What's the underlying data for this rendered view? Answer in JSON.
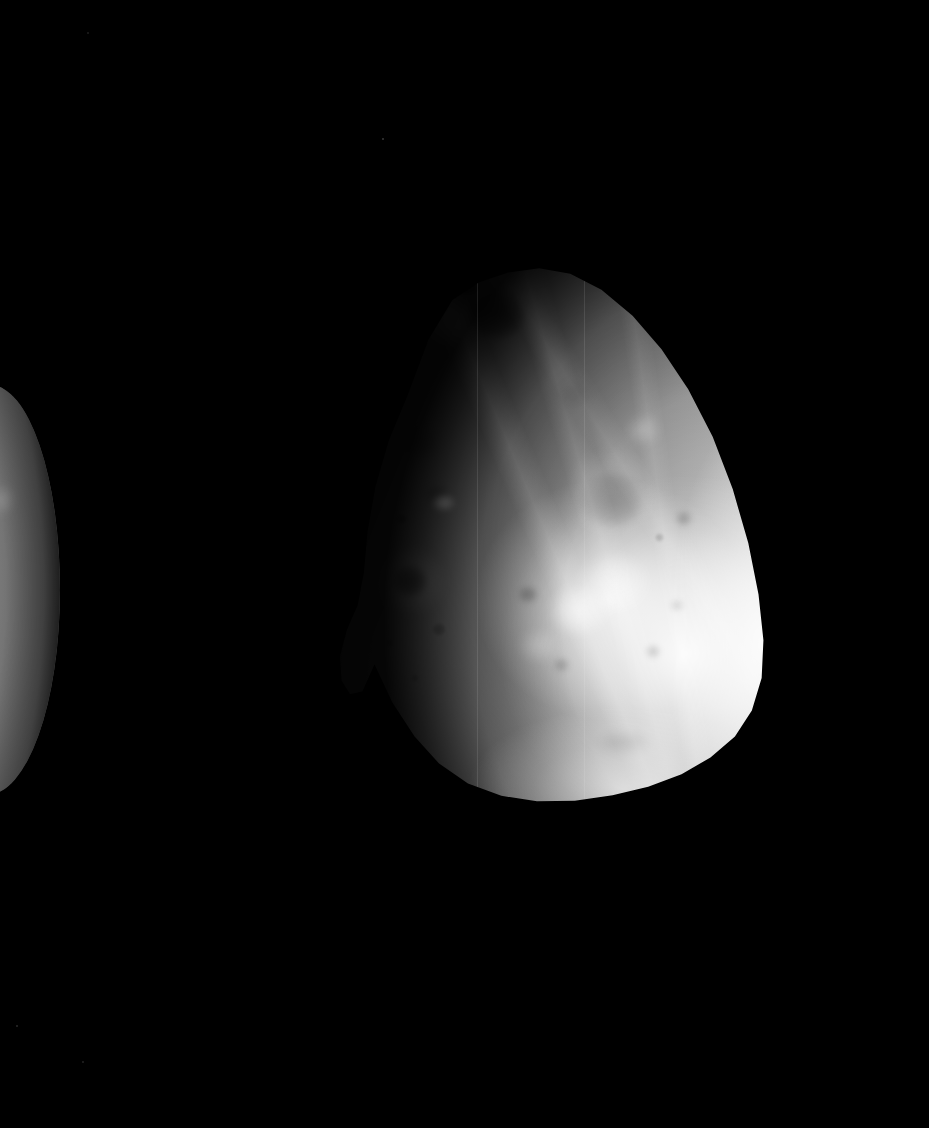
{
  "viewer": {
    "title": "Deimos — full-disk spacecraft image",
    "canvas_width": 929,
    "canvas_height": 1128,
    "background_color": "#000000",
    "image_mode": "grayscale",
    "overlay_text": "",
    "caption": ""
  },
  "scene": {
    "background_color": "#000000",
    "bodies": [
      {
        "name": "deimos-primary",
        "label": "Deimos",
        "role": "primary-subject",
        "shape_description": "irregular rounded-triangular body, apex toward upper-left",
        "bounds_px": {
          "left": 330,
          "top": 265,
          "width": 445,
          "height": 540
        },
        "illumination": "sunlit from the lower-right; terminator on the upper-left limb",
        "brightest_region_px": {
          "x": 588,
          "y": 612
        },
        "darkest_limb_side": "upper-left",
        "surface_tone_hex": "#b9b9b9",
        "limb_highlight_hex": "#ffffff",
        "terminator_shadow_hex": "#2e2e2e"
      },
      {
        "name": "companion-limb",
        "label": "Companion body (partial limb)",
        "role": "partially-visible-foreground-body",
        "shape_description": "crescent sliver of a second body cropped by the left frame edge",
        "bounds_px": {
          "left": -92,
          "top": 385,
          "width": 152,
          "height": 410
        },
        "illumination": "sunlit from the left; limb darkens to the right",
        "surface_tone_hex": "#adadad",
        "limb_highlight_hex": "#e8e8e8",
        "terminator_shadow_hex": "#3a3a3a"
      }
    ],
    "stars": [
      {
        "x": 383,
        "y": 139,
        "radius": 1.1,
        "brightness": 0.22
      },
      {
        "x": 17,
        "y": 1026,
        "radius": 1.0,
        "brightness": 0.16
      },
      {
        "x": 83,
        "y": 1062,
        "radius": 0.9,
        "brightness": 0.13
      },
      {
        "x": 88,
        "y": 33,
        "radius": 0.8,
        "brightness": 0.1
      }
    ],
    "primary_features": [
      {
        "name": "summit-crater-dark",
        "type": "crater",
        "cx_pct": 37.5,
        "cy_pct": 9.0,
        "w_pct": 13.0,
        "h_pct": 9.5,
        "tone": "dark",
        "strength": 0.6,
        "blur": 2
      },
      {
        "name": "summit-crater-notch",
        "type": "crater",
        "cx_pct": 31.0,
        "cy_pct": 4.2,
        "w_pct": 5.6,
        "h_pct": 3.2,
        "tone": "dark",
        "strength": 0.72,
        "blur": 1
      },
      {
        "name": "summit-bright-rim",
        "type": "bright-rim",
        "cx_pct": 26.5,
        "cy_pct": 10.5,
        "w_pct": 13.0,
        "h_pct": 9.0,
        "tone": "bright",
        "strength": 0.3,
        "blur": 3
      },
      {
        "name": "upper-left-patch",
        "type": "crater",
        "cx_pct": 20.5,
        "cy_pct": 33.0,
        "w_pct": 8.0,
        "h_pct": 5.5,
        "tone": "dark",
        "strength": 0.18,
        "blur": 3
      },
      {
        "name": "mid-left-crater-a",
        "type": "crater",
        "cx_pct": 24.0,
        "cy_pct": 42.5,
        "w_pct": 5.4,
        "h_pct": 3.6,
        "tone": "dark",
        "strength": 0.22,
        "blur": 2
      },
      {
        "name": "mid-left-crater-b",
        "type": "crater",
        "cx_pct": 16.0,
        "cy_pct": 47.0,
        "w_pct": 2.4,
        "h_pct": 1.8,
        "tone": "dark",
        "strength": 0.3,
        "blur": 1
      },
      {
        "name": "bright-spot-west",
        "type": "bright-spot",
        "cx_pct": 25.5,
        "cy_pct": 44.0,
        "w_pct": 5.0,
        "h_pct": 3.2,
        "tone": "bright",
        "strength": 0.55,
        "blur": 2
      },
      {
        "name": "dark-crater-west",
        "type": "crater",
        "cx_pct": 18.0,
        "cy_pct": 58.5,
        "w_pct": 7.8,
        "h_pct": 5.8,
        "tone": "dark",
        "strength": 0.78,
        "blur": 2
      },
      {
        "name": "dark-crater-west-halo",
        "type": "bright-rim",
        "cx_pct": 18.0,
        "cy_pct": 58.5,
        "w_pct": 16.0,
        "h_pct": 12.5,
        "tone": "bright",
        "strength": 0.16,
        "blur": 4
      },
      {
        "name": "central-crater",
        "type": "crater",
        "cx_pct": 63.5,
        "cy_pct": 43.5,
        "w_pct": 14.0,
        "h_pct": 10.5,
        "tone": "dark",
        "strength": 0.26,
        "blur": 3
      },
      {
        "name": "central-crater-rim",
        "type": "bright-rim",
        "cx_pct": 63.0,
        "cy_pct": 42.0,
        "w_pct": 21.0,
        "h_pct": 16.0,
        "tone": "bright",
        "strength": 0.16,
        "blur": 4
      },
      {
        "name": "upper-right-patch",
        "type": "crater",
        "cx_pct": 55.0,
        "cy_pct": 24.0,
        "w_pct": 7.0,
        "h_pct": 4.6,
        "tone": "dark",
        "strength": 0.12,
        "blur": 4
      },
      {
        "name": "upper-right-bright",
        "type": "bright-spot",
        "cx_pct": 70.5,
        "cy_pct": 30.5,
        "w_pct": 7.5,
        "h_pct": 5.5,
        "tone": "bright",
        "strength": 0.26,
        "blur": 4
      },
      {
        "name": "right-crater-small",
        "type": "crater",
        "cx_pct": 79.5,
        "cy_pct": 47.0,
        "w_pct": 3.6,
        "h_pct": 2.8,
        "tone": "dark",
        "strength": 0.22,
        "blur": 2
      },
      {
        "name": "right-crater-tiny",
        "type": "crater",
        "cx_pct": 74.0,
        "cy_pct": 50.5,
        "w_pct": 2.0,
        "h_pct": 1.6,
        "tone": "dark",
        "strength": 0.2,
        "blur": 1
      },
      {
        "name": "bright-ejecta-core",
        "type": "bright-spot",
        "cx_pct": 56.0,
        "cy_pct": 64.0,
        "w_pct": 13.0,
        "h_pct": 9.0,
        "tone": "bright",
        "strength": 0.62,
        "blur": 4
      },
      {
        "name": "bright-ejecta-north",
        "type": "bright-spot",
        "cx_pct": 64.0,
        "cy_pct": 59.0,
        "w_pct": 16.0,
        "h_pct": 11.0,
        "tone": "bright",
        "strength": 0.46,
        "blur": 5
      },
      {
        "name": "bright-ejecta-south",
        "type": "bright-spot",
        "cx_pct": 47.0,
        "cy_pct": 70.5,
        "w_pct": 9.0,
        "h_pct": 6.0,
        "tone": "bright",
        "strength": 0.3,
        "blur": 4
      },
      {
        "name": "mid-crater-centre",
        "type": "crater",
        "cx_pct": 44.5,
        "cy_pct": 61.0,
        "w_pct": 4.4,
        "h_pct": 3.2,
        "tone": "dark",
        "strength": 0.26,
        "blur": 2
      },
      {
        "name": "lower-crater-a",
        "type": "crater",
        "cx_pct": 52.0,
        "cy_pct": 74.0,
        "w_pct": 3.4,
        "h_pct": 2.6,
        "tone": "dark",
        "strength": 0.2,
        "blur": 2
      },
      {
        "name": "lower-crater-b",
        "type": "crater",
        "cx_pct": 72.5,
        "cy_pct": 71.5,
        "w_pct": 3.2,
        "h_pct": 2.4,
        "tone": "dark",
        "strength": 0.18,
        "blur": 2
      },
      {
        "name": "lower-crater-c",
        "type": "crater",
        "cx_pct": 78.0,
        "cy_pct": 63.0,
        "w_pct": 2.6,
        "h_pct": 2.0,
        "tone": "dark",
        "strength": 0.16,
        "blur": 2
      },
      {
        "name": "lower-right-groove",
        "type": "crater",
        "cx_pct": 66.0,
        "cy_pct": 88.5,
        "w_pct": 11.0,
        "h_pct": 4.0,
        "tone": "dark",
        "strength": 0.14,
        "blur": 4
      },
      {
        "name": "lower-left-crater",
        "type": "crater",
        "cx_pct": 24.5,
        "cy_pct": 67.5,
        "w_pct": 3.0,
        "h_pct": 2.4,
        "tone": "dark",
        "strength": 0.26,
        "blur": 1
      },
      {
        "name": "lower-left-speck",
        "type": "crater",
        "cx_pct": 13.5,
        "cy_pct": 70.0,
        "w_pct": 1.8,
        "h_pct": 1.4,
        "tone": "dark",
        "strength": 0.22,
        "blur": 1
      },
      {
        "name": "bottom-left-speck",
        "type": "crater",
        "cx_pct": 19.0,
        "cy_pct": 76.5,
        "w_pct": 1.8,
        "h_pct": 1.4,
        "tone": "dark",
        "strength": 0.18,
        "blur": 1
      }
    ],
    "secondary_features": [
      {
        "name": "companion-bright-crater",
        "type": "bright-spot",
        "cx_pct": 20.0,
        "cy_pct": 44.0,
        "w_pct": 30.0,
        "h_pct": 17.0,
        "tone": "bright",
        "strength": 0.55,
        "blur": 3
      },
      {
        "name": "companion-crater-rim",
        "type": "crater",
        "cx_pct": 34.0,
        "cy_pct": 45.0,
        "w_pct": 10.0,
        "h_pct": 9.0,
        "tone": "dark",
        "strength": 0.16,
        "blur": 3
      },
      {
        "name": "companion-patch-north",
        "type": "bright-spot",
        "cx_pct": 62.0,
        "cy_pct": 28.0,
        "w_pct": 14.0,
        "h_pct": 7.0,
        "tone": "bright",
        "strength": 0.22,
        "blur": 4
      },
      {
        "name": "companion-patch-south",
        "type": "bright-spot",
        "cx_pct": 30.0,
        "cy_pct": 76.0,
        "w_pct": 22.0,
        "h_pct": 10.0,
        "tone": "bright",
        "strength": 0.2,
        "blur": 4
      },
      {
        "name": "companion-mottle-a",
        "type": "crater",
        "cx_pct": 48.0,
        "cy_pct": 18.0,
        "w_pct": 12.0,
        "h_pct": 7.0,
        "tone": "dark",
        "strength": 0.12,
        "blur": 4
      },
      {
        "name": "companion-mottle-b",
        "type": "crater",
        "cx_pct": 40.0,
        "cy_pct": 62.0,
        "w_pct": 16.0,
        "h_pct": 9.0,
        "tone": "dark",
        "strength": 0.1,
        "blur": 4
      }
    ],
    "scan_seams_pct": [
      33.0,
      57.0
    ]
  }
}
